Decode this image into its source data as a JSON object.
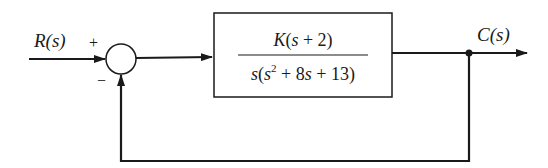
{
  "diagram": {
    "type": "block-diagram",
    "input": {
      "label": "R(s)"
    },
    "output": {
      "label": "C(s)"
    },
    "summing_junction": {
      "plus_sign": "+",
      "minus_sign": "−"
    },
    "plant_block": {
      "numerator": "K(s + 2)",
      "denominator_prefix": "s(s",
      "denominator_exponent": "2",
      "denominator_suffix": " + 8s + 13)"
    },
    "feedback": "unity negative feedback",
    "colors": {
      "line": "#1a1a1a",
      "background": "#ffffff"
    }
  }
}
